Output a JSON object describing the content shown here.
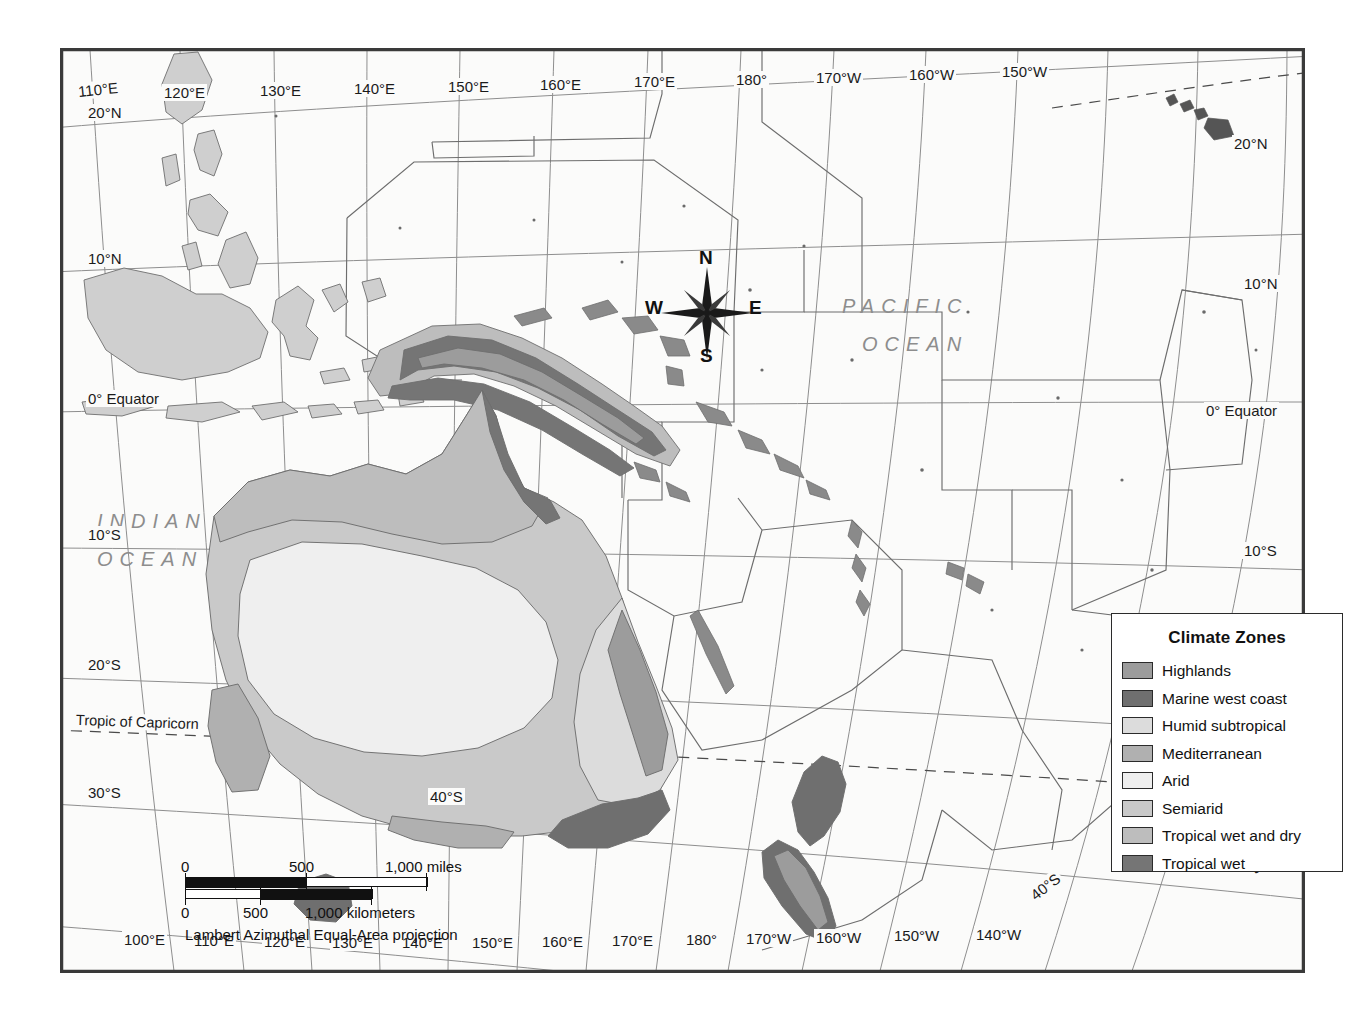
{
  "map": {
    "projection_note": "Lambert Azimuthal Equal-Area projection",
    "ocean_labels": [
      {
        "name": "pacific-ocean",
        "line1": "PACIFIC",
        "line2": "OCEAN"
      },
      {
        "name": "indian-ocean",
        "line1": "INDIAN",
        "line2": "OCEAN"
      }
    ],
    "compass": {
      "north": "N",
      "south": "S",
      "east": "E",
      "west": "W"
    },
    "scale": {
      "miles": {
        "ticks": [
          "0",
          "500",
          "1,000 miles"
        ],
        "unit": "miles"
      },
      "kilometers": {
        "ticks": [
          "0",
          "500",
          "1,000 kilometers"
        ],
        "unit": "kilometers"
      }
    },
    "graticule": {
      "top_longitudes": [
        "110°E",
        "120°E",
        "130°E",
        "140°E",
        "150°E",
        "160°E",
        "170°E",
        "180°",
        "170°W",
        "160°W",
        "150°W"
      ],
      "bottom_longitudes": [
        "100°E",
        "110°E",
        "120°E",
        "130°E",
        "140°E",
        "150°E",
        "160°E",
        "170°E",
        "180°",
        "170°W",
        "160°W",
        "150°W",
        "140°W"
      ],
      "left_latitudes": [
        "20°N",
        "10°N",
        "0° Equator",
        "10°S",
        "20°S",
        "30°S"
      ],
      "right_latitudes": [
        "20°N",
        "10°N",
        "0° Equator",
        "10°S",
        "20°S",
        "30°S"
      ],
      "interior_latitudes": [
        "40°S"
      ],
      "tropic_labels": [
        "Tropic of Capricorn",
        "Tropic of Capricorn"
      ],
      "bottom_interior_latitudes": [
        "40°S",
        "30°S"
      ]
    }
  },
  "legend": {
    "title": "Climate Zones",
    "items": [
      {
        "label": "Highlands",
        "color": "#9c9c9c"
      },
      {
        "label": "Marine west coast",
        "color": "#6f6f6f"
      },
      {
        "label": "Humid subtropical",
        "color": "#dcdcdc"
      },
      {
        "label": "Mediterranean",
        "color": "#b0b0b0"
      },
      {
        "label": "Arid",
        "color": "#efefef"
      },
      {
        "label": "Semiarid",
        "color": "#c9c9c9"
      },
      {
        "label": "Tropical wet and dry",
        "color": "#bdbdbd"
      },
      {
        "label": "Tropical wet",
        "color": "#757575"
      }
    ]
  }
}
